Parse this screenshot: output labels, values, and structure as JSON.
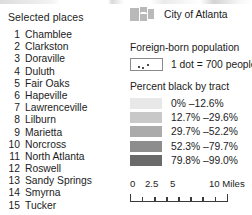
{
  "places": {
    "title": "Selected places",
    "items": [
      {
        "num": "1",
        "name": "Chamblee"
      },
      {
        "num": "2",
        "name": "Clarkston"
      },
      {
        "num": "3",
        "name": "Doraville"
      },
      {
        "num": "4",
        "name": "Duluth"
      },
      {
        "num": "5",
        "name": "Fair Oaks"
      },
      {
        "num": "6",
        "name": "Hapeville"
      },
      {
        "num": "7",
        "name": "Lawrenceville"
      },
      {
        "num": "8",
        "name": "Lilburn"
      },
      {
        "num": "9",
        "name": "Marietta"
      },
      {
        "num": "10",
        "name": "Norcross"
      },
      {
        "num": "11",
        "name": "North Atlanta"
      },
      {
        "num": "12",
        "name": "Roswell"
      },
      {
        "num": "13",
        "name": "Sandy Springs"
      },
      {
        "num": "14",
        "name": "Smyrna"
      },
      {
        "num": "15",
        "name": "Tucker"
      }
    ]
  },
  "city": {
    "label": "City of Atlanta",
    "swatch_color": "#b9b9b9",
    "swatch_icon": "city-boundary-patch-icon"
  },
  "foreign_born": {
    "title": "Foreign-born population",
    "label": "1 dot = 700 people",
    "dots_per_unit": 700,
    "swatch_icon": "dot-density-icon"
  },
  "percent_black": {
    "title": "Percent black by tract",
    "classes": [
      {
        "label": "0% –12.6%",
        "color": "#e8e8e8"
      },
      {
        "label": "12.7% –29.6%",
        "color": "#c8c8c8"
      },
      {
        "label": "29.7% –52.2%",
        "color": "#ababab"
      },
      {
        "label": "52.3% –79.7%",
        "color": "#8d8d8d"
      },
      {
        "label": "79.8% –99.0%",
        "color": "#6a6a6a"
      }
    ]
  },
  "scale_bar": {
    "labels": {
      "zero": "0",
      "two_five": "2.5",
      "five": "5",
      "ten_units": "10 Miles"
    },
    "max_value": 10,
    "units": "Miles",
    "tick_count": 9
  },
  "chart_data": {
    "type": "table",
    "legend_position": "panel",
    "categories": [
      "0% –12.6%",
      "12.7% –29.6%",
      "29.7% –52.2%",
      "52.3% –79.7%",
      "79.8% –99.0%"
    ],
    "values": [
      12.6,
      29.6,
      52.2,
      79.7,
      99.0
    ],
    "xlabel": "Percent black by tract",
    "ylabel": "",
    "ylim": [
      0,
      99
    ]
  }
}
